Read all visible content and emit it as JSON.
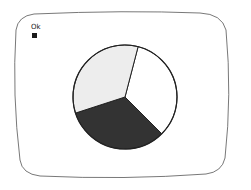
{
  "legend": {
    "label": "Ok",
    "swatch_color": "#1a1a1a"
  },
  "colors": {
    "frame_border": "#555555",
    "pie_border": "#222222",
    "background": "#ffffff"
  },
  "chart_data": {
    "type": "pie",
    "title": "",
    "legend": [
      "Ok"
    ],
    "legend_position": "top-left",
    "slices": [
      {
        "name": "white",
        "value": 33.4,
        "color": "#ffffff",
        "start_deg": 14.6,
        "end_deg": 135
      },
      {
        "name": "dark",
        "value": 32.6,
        "color": "#333333",
        "start_deg": 135,
        "end_deg": 252
      },
      {
        "name": "light-gray",
        "value": 34.0,
        "color": "#ededed",
        "start_deg": 252,
        "end_deg": 374.6
      }
    ],
    "values": [
      33.4,
      32.6,
      34.0
    ],
    "center": [
      125,
      97
    ],
    "radius": 52
  }
}
